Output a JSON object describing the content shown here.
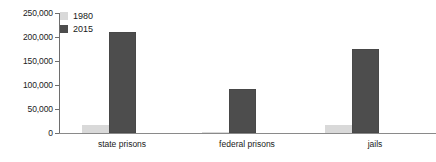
{
  "chart_data": {
    "type": "bar",
    "title": "",
    "xlabel": "",
    "ylabel": "",
    "categories": [
      "state prisons",
      "federal prisons",
      "jails"
    ],
    "series": [
      {
        "name": "1980",
        "values": [
          17000,
          2000,
          17000
        ],
        "color": "#d9d9d9"
      },
      {
        "name": "2015",
        "values": [
          210000,
          92000,
          175000
        ],
        "color": "#4d4d4d"
      }
    ],
    "ylim": [
      0,
      250000
    ],
    "yticks": [
      0,
      50000,
      100000,
      150000,
      200000,
      250000
    ],
    "ytick_labels": [
      "0",
      "50,000",
      "100,000",
      "150,000",
      "200,000",
      "250,000"
    ],
    "grid": false,
    "legend_position": "top-left"
  },
  "axis": {
    "tick_labels": [
      "250,000",
      "200,000",
      "150,000",
      "100,000",
      "50,000",
      "0"
    ]
  },
  "legend": {
    "entries": [
      {
        "label": "1980",
        "swatch": "legend-swatch-1980"
      },
      {
        "label": "2015",
        "swatch": "legend-swatch-2015"
      }
    ]
  },
  "categories": {
    "items": [
      "state prisons",
      "federal prisons",
      "jails"
    ]
  },
  "colors": {
    "series_1980": "#d9d9d9",
    "series_2015": "#4d4d4d",
    "axis": "#6e6e6e",
    "text": "#1a1a1a"
  }
}
